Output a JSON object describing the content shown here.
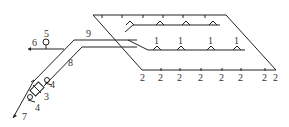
{
  "diagram": {
    "type": "sprinkler-piping-schematic",
    "labels": {
      "sprinkler_upper": "1",
      "branch_end": "2",
      "alarm_valve": "3",
      "gate_valve": "4",
      "pressure_gauge": "5",
      "test_outlet": "6",
      "supply_inlet": "7",
      "riser_pipe": "8",
      "main_pipe": "9"
    },
    "middle_branch_labels": [
      "1",
      "1",
      "1",
      "1"
    ],
    "bottom_branch_labels": [
      "2",
      "2",
      "2",
      "2",
      "2",
      "2",
      "2",
      "2"
    ],
    "colors": {
      "line": "#222222",
      "text": "#333333",
      "background": "#ffffff"
    }
  }
}
